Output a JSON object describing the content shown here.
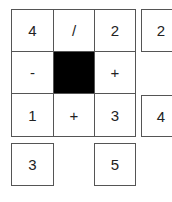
{
  "puzzle": {
    "main_grid": [
      [
        "4",
        "/",
        "2"
      ],
      [
        "-",
        "",
        "+"
      ],
      [
        "1",
        "+",
        "3"
      ]
    ],
    "blocked_cell": {
      "row": 1,
      "col": 1
    },
    "right_column": {
      "row0": "2",
      "row2": "4"
    },
    "bottom_row": {
      "col0": "3",
      "col2": "5"
    },
    "colors": {
      "border": "#555555",
      "blocked": "#000000",
      "background": "#ffffff"
    }
  }
}
